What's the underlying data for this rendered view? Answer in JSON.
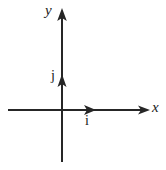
{
  "figure": {
    "title": "",
    "background_color": "#ffffff",
    "stroke_color": "#262626",
    "width": 166,
    "height": 170
  },
  "axes": {
    "y_axis": {
      "label": "y",
      "label_style": "italic",
      "orientation": "vertical",
      "x": 62,
      "from_y": 162,
      "to_y": 8,
      "arrow": "up"
    },
    "x_axis": {
      "label": "x",
      "label_style": "italic",
      "orientation": "horizontal",
      "y": 110,
      "from_x": 8,
      "to_x": 150,
      "arrow": "right"
    },
    "origin": {
      "x": 62,
      "y": 110
    }
  },
  "vectors": [
    {
      "label": "j",
      "label_style": "roman",
      "direction": "up",
      "from": {
        "x": 62,
        "y": 110
      },
      "to": {
        "x": 62,
        "y": 75
      }
    },
    {
      "label": "i",
      "label_style": "roman",
      "direction": "right",
      "from": {
        "x": 62,
        "y": 110
      },
      "to": {
        "x": 96,
        "y": 110
      }
    }
  ]
}
